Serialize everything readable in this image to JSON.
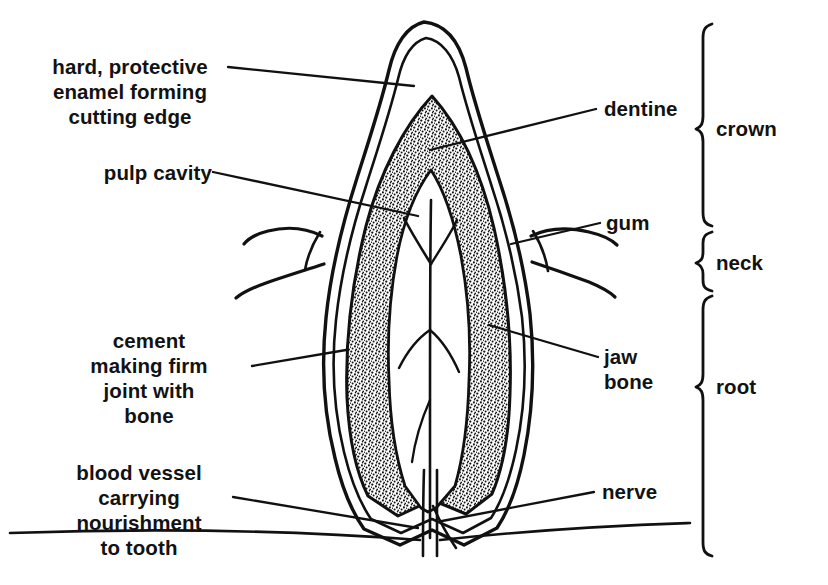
{
  "figure": {
    "kind": "anatomical-diagram",
    "subject": "tooth",
    "background_color": "#ffffff",
    "ink_color": "#111111"
  },
  "labels_left": [
    {
      "name": "enamel",
      "text": "hard, protective\nenamel forming\ncutting edge",
      "align": "center"
    },
    {
      "name": "pulp-cavity",
      "text": "pulp cavity",
      "align": "right"
    },
    {
      "name": "cement",
      "text": "cement\nmaking firm\njoint with\nbone",
      "align": "center"
    },
    {
      "name": "blood-vessel",
      "text": "blood vessel\ncarrying\nnourishment\nto tooth",
      "align": "center"
    }
  ],
  "labels_right": [
    {
      "name": "dentine",
      "text": "dentine"
    },
    {
      "name": "gum",
      "text": "gum"
    },
    {
      "name": "jaw-bone",
      "text": "jaw\nbone"
    },
    {
      "name": "nerve",
      "text": "nerve"
    }
  ],
  "region_brackets": [
    {
      "name": "crown",
      "text": "crown"
    },
    {
      "name": "neck",
      "text": "neck"
    },
    {
      "name": "root",
      "text": "root"
    }
  ]
}
